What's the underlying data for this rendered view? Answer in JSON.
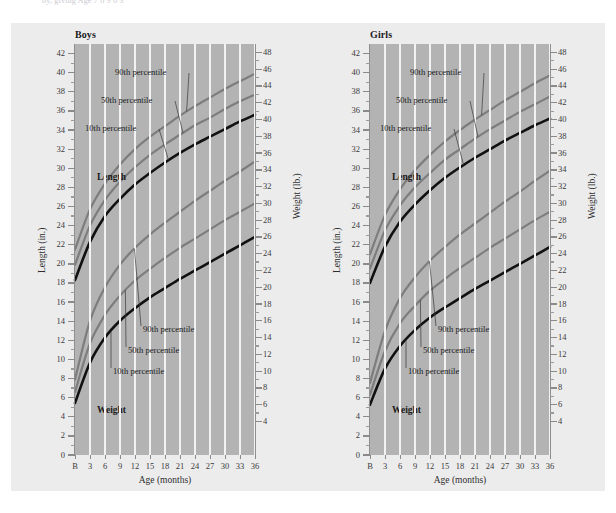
{
  "top_text": "by, giving Age                                                           7        6        9        6        3",
  "chart_data": {
    "type": "line",
    "xlabel": "Age (months)",
    "x_tick_labels": [
      "B",
      "3",
      "6",
      "9",
      "12",
      "15",
      "18",
      "21",
      "24",
      "27",
      "30",
      "33",
      "36"
    ],
    "x": [
      0,
      3,
      6,
      9,
      12,
      15,
      18,
      21,
      24,
      27,
      30,
      33,
      36
    ],
    "grid": "vertical-white-on-gray",
    "legend": "inline-annotations",
    "axes": [
      {
        "side": "left",
        "label": "Length (in.)",
        "unit": "in.",
        "range": [
          0,
          43
        ],
        "tick_labels": [
          "42",
          "40",
          "38",
          "36",
          "34",
          "32",
          "30",
          "28",
          "26",
          "24",
          "22",
          "20",
          "18",
          "16",
          "14",
          "12",
          "10",
          "8",
          "6",
          "4",
          "2",
          "0"
        ]
      },
      {
        "side": "right",
        "label": "Weight (lb.)",
        "unit": "lb.",
        "range": [
          0,
          49
        ],
        "tick_labels": [
          "48",
          "46",
          "44",
          "42",
          "40",
          "38",
          "36",
          "34",
          "32",
          "30",
          "28",
          "26",
          "24",
          "22",
          "20",
          "18",
          "16",
          "14",
          "12",
          "10",
          "8",
          "6",
          "4"
        ]
      }
    ],
    "panels": [
      {
        "name": "Boys",
        "series": [
          {
            "name": "Length 90th percentile",
            "metric": "length",
            "percentile": "90th",
            "axis": "left",
            "color": "#7d7d7d",
            "values": [
              21.5,
              25.7,
              28.4,
              30.4,
              32.0,
              33.3,
              34.4,
              35.5,
              36.5,
              37.4,
              38.3,
              39.1,
              39.9
            ]
          },
          {
            "name": "Length 50th percentile",
            "metric": "length",
            "percentile": "50th",
            "axis": "left",
            "color": "#7d7d7d",
            "values": [
              19.9,
              24.0,
              26.7,
              28.6,
              30.1,
              31.4,
              32.5,
              33.5,
              34.5,
              35.3,
              36.2,
              37.0,
              37.7
            ]
          },
          {
            "name": "Length 10th percentile",
            "metric": "length",
            "percentile": "10th",
            "axis": "left",
            "color": "#111111",
            "values": [
              18.3,
              22.3,
              25.0,
              26.8,
              28.3,
              29.5,
              30.6,
              31.6,
              32.5,
              33.3,
              34.1,
              34.9,
              35.6
            ]
          },
          {
            "name": "Weight 90th percentile",
            "metric": "weight",
            "percentile": "90th",
            "axis": "right",
            "color": "#7d7d7d",
            "values": [
              9.0,
              16.0,
              20.0,
              22.7,
              24.7,
              26.3,
              27.7,
              29.0,
              30.3,
              31.5,
              32.7,
              33.8,
              35.0
            ]
          },
          {
            "name": "Weight 50th percentile",
            "metric": "weight",
            "percentile": "50th",
            "axis": "right",
            "color": "#7d7d7d",
            "values": [
              7.5,
              13.3,
              16.7,
              19.0,
              20.8,
              22.2,
              23.5,
              24.7,
              25.8,
              26.9,
              28.0,
              29.0,
              30.0
            ]
          },
          {
            "name": "Weight 10th percentile",
            "metric": "weight",
            "percentile": "10th",
            "axis": "right",
            "color": "#111111",
            "values": [
              6.2,
              11.0,
              14.0,
              16.0,
              17.5,
              18.8,
              19.9,
              21.0,
              22.0,
              23.0,
              24.0,
              25.0,
              26.0
            ]
          }
        ],
        "annotations": [
          {
            "text": "Length",
            "kind": "group-label"
          },
          {
            "text": "Weight",
            "kind": "group-label"
          },
          {
            "text": "90th percentile",
            "kind": "callout",
            "target": "length-90"
          },
          {
            "text": "50th percentile",
            "kind": "callout",
            "target": "length-50"
          },
          {
            "text": "10th percentile",
            "kind": "callout",
            "target": "length-10"
          },
          {
            "text": "90th percentile",
            "kind": "callout",
            "target": "weight-90"
          },
          {
            "text": "50th percentile",
            "kind": "callout",
            "target": "weight-50"
          },
          {
            "text": "10th percentile",
            "kind": "callout",
            "target": "weight-10"
          }
        ]
      },
      {
        "name": "Girls",
        "series": [
          {
            "name": "Length 90th percentile",
            "metric": "length",
            "percentile": "90th",
            "axis": "left",
            "color": "#7d7d7d",
            "values": [
              21.0,
              25.1,
              27.8,
              29.8,
              31.4,
              32.8,
              34.0,
              35.1,
              36.1,
              37.1,
              38.0,
              38.9,
              39.7
            ]
          },
          {
            "name": "Length 50th percentile",
            "metric": "length",
            "percentile": "50th",
            "axis": "left",
            "color": "#7d7d7d",
            "values": [
              19.5,
              23.5,
              26.1,
              28.0,
              29.5,
              30.9,
              32.0,
              33.1,
              34.1,
              35.0,
              35.9,
              36.7,
              37.5
            ]
          },
          {
            "name": "Length 10th percentile",
            "metric": "length",
            "percentile": "10th",
            "axis": "left",
            "color": "#111111",
            "values": [
              18.0,
              21.8,
              24.4,
              26.2,
              27.7,
              29.0,
              30.1,
              31.1,
              32.0,
              32.9,
              33.7,
              34.5,
              35.2
            ]
          },
          {
            "name": "Weight 90th percentile",
            "metric": "weight",
            "percentile": "90th",
            "axis": "right",
            "color": "#7d7d7d",
            "values": [
              8.6,
              14.8,
              18.7,
              21.2,
              23.2,
              24.8,
              26.3,
              27.6,
              28.9,
              30.2,
              31.4,
              32.7,
              33.9
            ]
          },
          {
            "name": "Weight 50th percentile",
            "metric": "weight",
            "percentile": "50th",
            "axis": "right",
            "color": "#7d7d7d",
            "values": [
              7.2,
              12.4,
              15.7,
              17.8,
              19.6,
              21.0,
              22.3,
              23.5,
              24.7,
              25.8,
              26.9,
              28.0,
              29.0
            ]
          },
          {
            "name": "Weight 10th percentile",
            "metric": "weight",
            "percentile": "10th",
            "axis": "right",
            "color": "#111111",
            "values": [
              6.0,
              10.3,
              13.0,
              14.9,
              16.4,
              17.6,
              18.7,
              19.8,
              20.8,
              21.8,
              22.8,
              23.8,
              24.8
            ]
          }
        ],
        "annotations": [
          {
            "text": "Length",
            "kind": "group-label"
          },
          {
            "text": "Weight",
            "kind": "group-label"
          },
          {
            "text": "90th percentile",
            "kind": "callout",
            "target": "length-90"
          },
          {
            "text": "50th percentile",
            "kind": "callout",
            "target": "length-50"
          },
          {
            "text": "10th percentile",
            "kind": "callout",
            "target": "length-10"
          },
          {
            "text": "90th percentile",
            "kind": "callout",
            "target": "weight-90"
          },
          {
            "text": "50th percentile",
            "kind": "callout",
            "target": "weight-50"
          },
          {
            "text": "10th percentile",
            "kind": "callout",
            "target": "weight-10"
          }
        ]
      }
    ],
    "colors": {
      "plot_background": "#b3b3b3",
      "card_background": "#ececed",
      "gridline": "#f2f2f2",
      "line_gray": "#7d7d7d",
      "line_black": "#111111",
      "text": "#2e2e2e"
    }
  }
}
